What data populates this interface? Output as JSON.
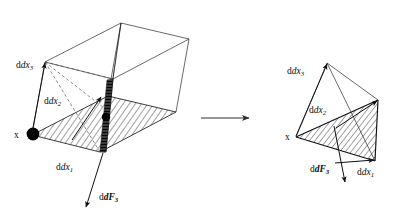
{
  "figure": {
    "background_color": "#ffffff",
    "ink_color": "#111111",
    "transition_arrow": {
      "name": "transformation-arrow",
      "direction": "right",
      "label": ""
    },
    "left_panel": {
      "name": "parallelepiped-element",
      "shape": "parallelepiped",
      "labels": {
        "origin": "x",
        "edge_1": "dx",
        "edge_1_sub": "1",
        "edge_2": "dx",
        "edge_2_sub": "2",
        "edge_3": "dx",
        "edge_3_sub": "3",
        "force": "dF",
        "force_sub": "3"
      },
      "features": {
        "base_face_shading": "diagonal-hatch",
        "cut_plane_shading": "horizontal-hatch-dark",
        "marker_points": 2,
        "dashed_construction_lines": 3
      }
    },
    "right_panel": {
      "name": "tetrahedron-element",
      "shape": "tetrahedron",
      "labels": {
        "origin": "x",
        "edge_1": "dx",
        "edge_1_sub": "1",
        "edge_2": "dx",
        "edge_2_sub": "2",
        "edge_3": "dx",
        "edge_3_sub": "3",
        "force": "dF",
        "force_sub": "3"
      },
      "features": {
        "inclined_face_shading": "diagonal-hatch",
        "marker_points": 0,
        "dashed_construction_lines": 0
      }
    }
  }
}
